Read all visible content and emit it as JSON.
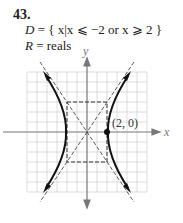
{
  "problem": {
    "number": "43.",
    "domain_prefix": "D",
    "domain_text": " = { x|x ⩽ −2 or x ⩾ 2 }",
    "range_prefix": "R",
    "range_text": " = reals"
  },
  "graph": {
    "x_axis_label": "x",
    "y_axis_label": "y",
    "point_label": "(2, 0)",
    "curve": "hyperbola x^2/4 - y^2/9 = 1",
    "vertices": [
      [
        -2,
        0
      ],
      [
        2,
        0
      ]
    ],
    "asymptotes": [
      "y = 1.5x",
      "y = -1.5x"
    ],
    "box": {
      "x": [
        -2,
        2
      ],
      "y": [
        -3,
        3
      ]
    },
    "grid_range": {
      "x": [
        -6,
        6
      ],
      "y": [
        -6,
        6
      ]
    }
  }
}
